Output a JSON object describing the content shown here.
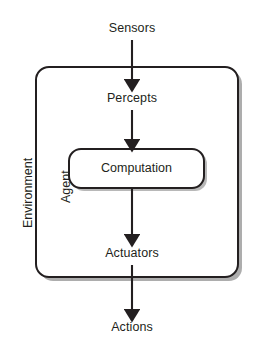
{
  "diagram": {
    "type": "flow-diagram",
    "orientation": "vertical-top-to-bottom",
    "colors": {
      "stroke": "#231f20",
      "background": "#ffffff",
      "shadow": "rgba(0,0,0,0.30)"
    },
    "nodes": {
      "sensors": {
        "label": "Sensors",
        "kind": "text-label"
      },
      "percepts": {
        "label": "Percepts",
        "kind": "text-label"
      },
      "computation": {
        "label": "Computation",
        "kind": "rounded-box"
      },
      "actuators": {
        "label": "Actuators",
        "kind": "text-label"
      },
      "actions": {
        "label": "Actions",
        "kind": "text-label"
      }
    },
    "containers": {
      "environment": {
        "label": "Environment",
        "kind": "rounded-box",
        "label_orientation": "vertical"
      },
      "agent": {
        "label": "Agent",
        "kind": "region-label",
        "label_orientation": "vertical"
      }
    },
    "edges": [
      {
        "from": "Sensors",
        "to": "Percepts",
        "style": "solid-arrow"
      },
      {
        "from": "Percepts",
        "to": "Computation",
        "style": "solid-arrow"
      },
      {
        "from": "Computation",
        "to": "Actuators",
        "style": "solid-arrow"
      },
      {
        "from": "Actuators",
        "to": "Actions",
        "style": "solid-arrow"
      }
    ]
  }
}
